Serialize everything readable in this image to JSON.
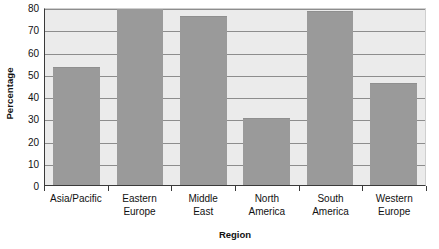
{
  "chart_data": {
    "type": "bar",
    "title": "",
    "subtitle": "",
    "xlabel": "Region",
    "ylabel": "Percentage",
    "categories": [
      "Asia/Pacific",
      "Eastern Europe",
      "Middle East",
      "North America",
      "South America",
      "Western Europe"
    ],
    "category_lines": [
      [
        "Asia/Pacific"
      ],
      [
        "Eastern",
        "Europe"
      ],
      [
        "Middle",
        "East"
      ],
      [
        "North",
        "America"
      ],
      [
        "South",
        "America"
      ],
      [
        "Western",
        "Europe"
      ]
    ],
    "values": [
      53,
      80,
      76,
      30,
      78,
      46
    ],
    "ylim": [
      0,
      80
    ],
    "yticks": [
      0,
      10,
      20,
      30,
      40,
      50,
      60,
      70,
      80
    ],
    "ytick_labels": [
      "0",
      "10",
      "20",
      "30",
      "40",
      "50",
      "60",
      "70",
      "80"
    ],
    "grid": "horizontal",
    "legend": "none",
    "colors": {
      "bar": "#9a9a9a",
      "plot_background": "#ebebeb",
      "gridline": "#8d8d8d",
      "axis": "#3a3a3a",
      "text": "#111111",
      "page_background": "#ffffff"
    }
  }
}
